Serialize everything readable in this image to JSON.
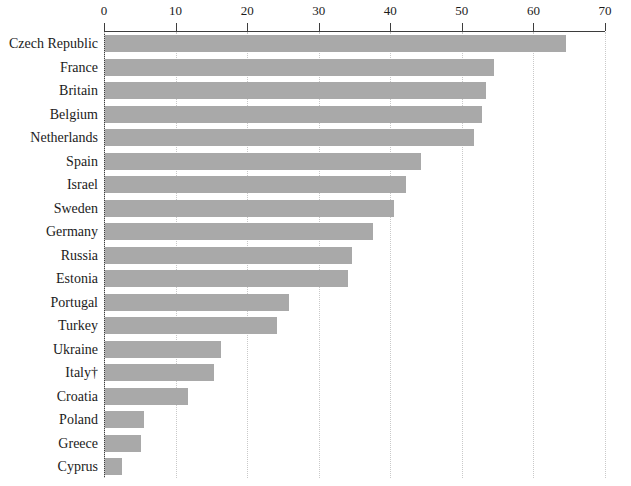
{
  "chart_data": {
    "type": "bar",
    "orientation": "horizontal",
    "title": "",
    "subtitle": "",
    "xlabel": "",
    "ylabel": "",
    "xlim": [
      0,
      70
    ],
    "ylim": null,
    "grid": "vertical-dotted",
    "legend": "none",
    "xticks": [
      0,
      10,
      20,
      30,
      40,
      50,
      60,
      70
    ],
    "xtick_labels": [
      "0",
      "10",
      "20",
      "30",
      "40",
      "50",
      "60",
      "70"
    ],
    "categories": [
      "Czech Republic",
      "France",
      "Britain",
      "Belgium",
      "Netherlands",
      "Spain",
      "Israel",
      "Sweden",
      "Germany",
      "Russia",
      "Estonia",
      "Portugal",
      "Turkey",
      "Ukraine",
      "Italy†",
      "Croatia",
      "Poland",
      "Greece",
      "Cyprus"
    ],
    "values": [
      64.4,
      54.3,
      53.2,
      52.7,
      51.5,
      44.2,
      42.0,
      40.4,
      37.4,
      34.5,
      34.0,
      25.7,
      24.0,
      16.2,
      15.2,
      11.6,
      5.4,
      5.0,
      2.4
    ],
    "annotations": [
      {
        "target": "Italy",
        "symbol": "†"
      }
    ],
    "colors": {
      "bar": "#a9a9a9",
      "axis": "#3d3d3d",
      "gridline": "#c9c9c9",
      "text": "#1b1b1b",
      "background": "#ffffff"
    }
  }
}
